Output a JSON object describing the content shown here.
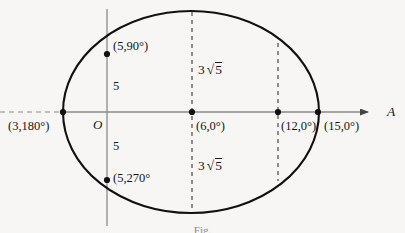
{
  "figure": {
    "type": "polar-conic-diagram",
    "caption": "Fig.",
    "axis_label": "A",
    "origin_label": "O",
    "background_color": "#f7f6f4",
    "ink_color": "#16161a",
    "axis_color": "#8a8a8a",
    "curve_color": "#111111"
  },
  "curve": {
    "name": "ellipse",
    "center": {
      "x": 191,
      "y": 112
    },
    "semi_axis_x": 128,
    "semi_axis_y": 101,
    "stroke_width": 2.1
  },
  "axes": {
    "x_axis": {
      "y": 112,
      "x_start": 0,
      "x_end": 372,
      "arrow": true
    },
    "y_axis": {
      "x": 107,
      "y_start": 10,
      "y_end": 225,
      "arrow": false
    },
    "dashed_segment": {
      "x_start": 0,
      "x_end": 63
    }
  },
  "dashed_verticals": [
    {
      "name": "chord-at-6",
      "x": 192,
      "y_top": 12,
      "y_bottom": 212
    },
    {
      "name": "chord-at-12",
      "x": 278,
      "y_top": 42,
      "y_bottom": 182
    }
  ],
  "points": [
    {
      "name": "point-3-180",
      "label": "(3,180°)",
      "x": 63,
      "y": 112,
      "label_x": 8,
      "label_y": 120
    },
    {
      "name": "point-5-90",
      "label": "(5,90°)",
      "x": 107,
      "y": 54,
      "label_x": 113,
      "label_y": 40
    },
    {
      "name": "point-5-270",
      "label": "(5,270°",
      "x": 107,
      "y": 180,
      "label_x": 113,
      "label_y": 172
    },
    {
      "name": "point-6-0",
      "label": "(6,0°)",
      "x": 192,
      "y": 112,
      "label_x": 196,
      "label_y": 120
    },
    {
      "name": "point-12-0",
      "label": "(12,0°)",
      "x": 278,
      "y": 112,
      "label_x": 281,
      "label_y": 120
    },
    {
      "name": "point-15-0",
      "label": "(15,0°)",
      "x": 318,
      "y": 112,
      "label_x": 324,
      "label_y": 120
    }
  ],
  "measure_labels": [
    {
      "name": "semi-latus-upper",
      "text": "5",
      "x": 113,
      "y": 80
    },
    {
      "name": "semi-latus-lower",
      "text": "5",
      "x": 113,
      "y": 140
    },
    {
      "name": "chord-upper",
      "coef": "3",
      "root": "5",
      "x": 198,
      "y": 62
    },
    {
      "name": "chord-lower",
      "coef": "3",
      "root": "5",
      "x": 198,
      "y": 158
    }
  ]
}
